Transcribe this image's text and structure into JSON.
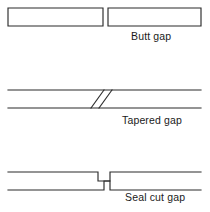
{
  "figure": {
    "name": "joint-gap-types",
    "background_color": "#ffffff",
    "line_color": "#2b2b2b",
    "text_color": "#1a1a1a"
  },
  "diagrams": [
    {
      "id": "butt-gap",
      "label": "Butt gap",
      "description": "Two closed rectangular bars separated by a small square-ended vertical gap",
      "geometry": {
        "left_bar": {
          "x": 8,
          "y": 8,
          "width": 95,
          "height": 18
        },
        "right_bar": {
          "x": 108,
          "y": 8,
          "width": 93,
          "height": 18
        },
        "gap_width": 5,
        "closed_ends": true
      }
    },
    {
      "id": "tapered-gap",
      "label": "Tapered gap",
      "description": "Open-ended bar crossed by two parallel diagonal scarf lines",
      "geometry": {
        "top_line_y": 90,
        "bottom_line_y": 108,
        "x_start": 8,
        "x_end": 201,
        "diagonal_1": {
          "x1": 91,
          "y1": 108,
          "x2": 104,
          "y2": 90
        },
        "diagonal_2": {
          "x1": 99,
          "y1": 108,
          "x2": 112,
          "y2": 90
        },
        "closed_ends": false
      }
    },
    {
      "id": "seal-cut-gap",
      "label": "Seal cut gap",
      "description": "Open-ended bar with an interlocking stepped Z-shaped seal cut joint",
      "geometry": {
        "top_line_y": 172,
        "bottom_line_y": 190,
        "x_start": 8,
        "x_end": 201,
        "step_left_x": 98,
        "step_right_x": 110,
        "step_mid_x": 104,
        "step_upper_y": 172,
        "step_mid_y": 181,
        "step_lower_y": 190,
        "closed_ends": false
      }
    }
  ]
}
